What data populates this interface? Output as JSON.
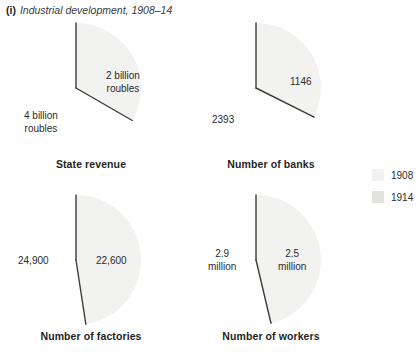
{
  "figure": {
    "marker": "(i)",
    "title": "Industrial development, 1908–14"
  },
  "legend": {
    "position": "right",
    "items": [
      {
        "label": "1908",
        "color": "#f2f2f1"
      },
      {
        "label": "1914",
        "color": "#e2e2e1"
      }
    ]
  },
  "colors": {
    "series_1908": "#f2f2f1",
    "series_1914": "#e2e2e1",
    "divider": "#3c3c3c",
    "text": "#2b2b2b"
  },
  "chart_data": {
    "type": "pie",
    "title": "Industrial development, 1908–14",
    "legend": [
      "1908",
      "1914"
    ],
    "legend_position": "right",
    "charts": [
      {
        "title": "State revenue",
        "categories": [
          "1908",
          "1914"
        ],
        "values": [
          2,
          4
        ],
        "unit": "billion roubles",
        "labels": [
          "2 billion\nroubles",
          "4 billion\nroubles"
        ],
        "percent": [
          33.3,
          66.7
        ],
        "label_positions": [
          {
            "x": 100,
            "y": 52
          },
          {
            "x": 18,
            "y": 92
          }
        ]
      },
      {
        "title": "Number of banks",
        "categories": [
          "1908",
          "1914"
        ],
        "values": [
          1146,
          2393
        ],
        "unit": "banks",
        "labels": [
          "1146",
          "2393"
        ],
        "percent": [
          32.4,
          67.6
        ],
        "label_positions": [
          {
            "x": 104,
            "y": 58
          },
          {
            "x": 26,
            "y": 96
          }
        ]
      },
      {
        "title": "Number of factories",
        "categories": [
          "1908",
          "1914"
        ],
        "values": [
          22600,
          24900
        ],
        "unit": "factories",
        "labels": [
          "22,600",
          "24,900"
        ],
        "percent": [
          47.6,
          52.4
        ],
        "label_positions": [
          {
            "x": 90,
            "y": 65
          },
          {
            "x": 12,
            "y": 65
          }
        ]
      },
      {
        "title": "Number of workers",
        "categories": [
          "1908",
          "1914"
        ],
        "values": [
          2.5,
          2.9
        ],
        "unit": "million workers",
        "labels": [
          "2.5\nmillion",
          "2.9\nmillion"
        ],
        "percent": [
          46.3,
          53.7
        ],
        "label_positions": [
          {
            "x": 92,
            "y": 58
          },
          {
            "x": 22,
            "y": 58
          }
        ]
      }
    ]
  }
}
